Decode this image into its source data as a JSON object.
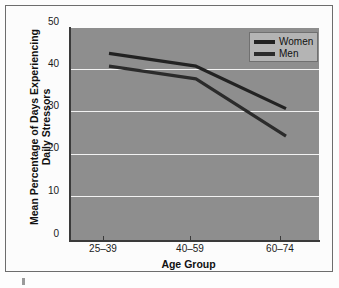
{
  "chart_data": {
    "type": "line",
    "title": "",
    "xlabel": "Age Group",
    "ylabel": "Mean Percentage of Days Experiencing Daily Stressors",
    "ylabel_line1": "Mean Percentage of Days Experiencing",
    "ylabel_line2": "Daily Stressors",
    "categories": [
      "25–39",
      "40–59",
      "60–74"
    ],
    "series": [
      {
        "name": "Women",
        "values": [
          44,
          41,
          31
        ],
        "color": "#222222"
      },
      {
        "name": "Men",
        "values": [
          41,
          38,
          24.5
        ],
        "color": "#2b2b2b"
      }
    ],
    "ylim": [
      0,
      50
    ],
    "yticks": [
      0,
      10,
      20,
      30,
      40,
      50
    ],
    "ytick_labels": [
      "0",
      "10",
      "20",
      "30",
      "40",
      "50"
    ],
    "grid": true,
    "grid_color": "#f2f2f2",
    "legend_position": "top-right",
    "plot_background": "#8e8e8e",
    "figure_background": "#fcfcfc"
  },
  "legend": {
    "entries": [
      {
        "label": "Women"
      },
      {
        "label": "Men"
      }
    ]
  },
  "axes": {
    "y_ticks": [
      {
        "label": "50"
      },
      {
        "label": "40"
      },
      {
        "label": "30"
      },
      {
        "label": "20"
      },
      {
        "label": "10"
      },
      {
        "label": "0"
      }
    ],
    "x_ticks": [
      {
        "label": "25–39"
      },
      {
        "label": "40–59"
      },
      {
        "label": "60–74"
      }
    ]
  }
}
